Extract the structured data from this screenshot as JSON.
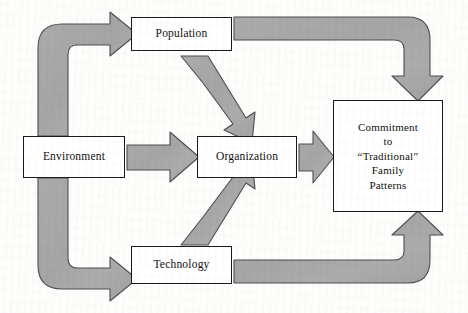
{
  "diagram": {
    "type": "flow-diagram",
    "background_color": "#fdfdfc",
    "arrow_fill_color": "#a8a8a8",
    "arrow_stroke_color": "#4f4f4f",
    "box_border_color": "#1a1a1a",
    "box_fill_color": "#ffffff",
    "text_color": "#13110f",
    "nodes": [
      {
        "id": "population",
        "label": "Population"
      },
      {
        "id": "environment",
        "label": "Environment"
      },
      {
        "id": "organization",
        "label": "Organization"
      },
      {
        "id": "technology",
        "label": "Technology"
      },
      {
        "id": "commitment",
        "label": "Commitment\nto\n“Traditional”\nFamily\nPatterns"
      }
    ],
    "arrows": [
      {
        "id": "environment-to-population",
        "from": "Environment",
        "to": "Population",
        "shape": "elbow-up-right"
      },
      {
        "id": "environment-to-technology",
        "from": "Environment",
        "to": "Technology",
        "shape": "elbow-down-right"
      },
      {
        "id": "environment-to-organization",
        "from": "Environment",
        "to": "Organization",
        "shape": "straight-right"
      },
      {
        "id": "population-to-organization",
        "from": "Population",
        "to": "Organization",
        "shape": "diagonal-down-right"
      },
      {
        "id": "technology-to-organization",
        "from": "Technology",
        "to": "Organization",
        "shape": "diagonal-up-right"
      },
      {
        "id": "organization-to-commitment",
        "from": "Organization",
        "to": "Commitment",
        "shape": "straight-right"
      },
      {
        "id": "population-to-commitment",
        "from": "Population",
        "to": "Commitment",
        "shape": "elbow-right-down"
      },
      {
        "id": "technology-to-commitment",
        "from": "Technology",
        "to": "Commitment",
        "shape": "elbow-right-up"
      }
    ]
  }
}
